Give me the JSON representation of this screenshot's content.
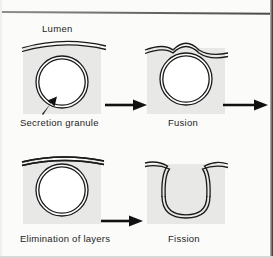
{
  "figure": {
    "background_color": "#fbfbfa",
    "cytoplasm_fill": "#e8e8e6",
    "line_color": "#1a1a1a"
  },
  "labels": {
    "lumen": "Lumen",
    "secretion_granule": "Secretion granule",
    "fusion": "Fusion",
    "elimination_of_layers": "Elimination of layers",
    "fission": "Fission"
  },
  "panels": [
    {
      "id": "panel-secretion-granule",
      "caption": "Secretion granule",
      "stage": 1
    },
    {
      "id": "panel-fusion",
      "caption": "Fusion",
      "stage": 2
    },
    {
      "id": "panel-elimination-of-layers",
      "caption": "Elimination of layers",
      "stage": 3
    },
    {
      "id": "panel-fission",
      "caption": "Fission",
      "stage": 4
    }
  ],
  "arrows": [
    {
      "id": "arrow-1",
      "direction": "right",
      "from": "panel-secretion-granule",
      "to": "panel-fusion"
    },
    {
      "id": "arrow-2",
      "direction": "right",
      "from": "panel-fusion",
      "to": "offpage"
    },
    {
      "id": "arrow-3",
      "direction": "right",
      "from": "panel-elimination-of-layers",
      "to": "panel-fission"
    }
  ],
  "pointer": {
    "id": "secretion-granule-pointer",
    "direction": "up-right",
    "target": "secretion granule membrane"
  }
}
